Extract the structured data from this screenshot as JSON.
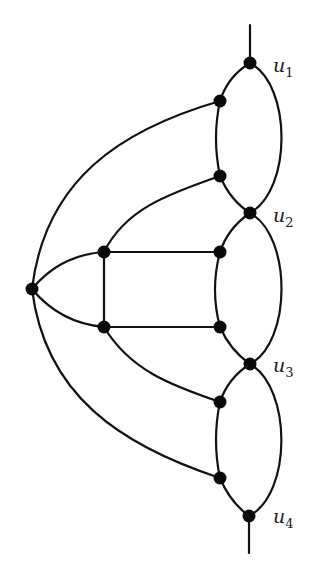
{
  "diagram": {
    "type": "graph",
    "colors": {
      "edge": "#111111",
      "node": "#0a0a0a",
      "background": "#ffffff"
    },
    "labels": [
      {
        "id": "u1",
        "base": "u",
        "sub": "1"
      },
      {
        "id": "u2",
        "base": "u",
        "sub": "2"
      },
      {
        "id": "u3",
        "base": "u",
        "sub": "3"
      },
      {
        "id": "u4",
        "base": "u",
        "sub": "4"
      }
    ],
    "nodes": [
      {
        "id": "u1",
        "x": 250,
        "y": 63
      },
      {
        "id": "a",
        "x": 220,
        "y": 101
      },
      {
        "id": "b",
        "x": 220,
        "y": 176
      },
      {
        "id": "u2",
        "x": 250,
        "y": 213
      },
      {
        "id": "sq_tl",
        "x": 104,
        "y": 252
      },
      {
        "id": "sq_tr",
        "x": 220,
        "y": 252
      },
      {
        "id": "hub",
        "x": 32,
        "y": 289
      },
      {
        "id": "sq_bl",
        "x": 104,
        "y": 327
      },
      {
        "id": "sq_br",
        "x": 220,
        "y": 327
      },
      {
        "id": "u3",
        "x": 250,
        "y": 364
      },
      {
        "id": "c",
        "x": 220,
        "y": 402
      },
      {
        "id": "d",
        "x": 220,
        "y": 478
      },
      {
        "id": "u4",
        "x": 249,
        "y": 516
      }
    ],
    "edges": [
      [
        "stub_top",
        "u1"
      ],
      [
        "u1",
        "a"
      ],
      [
        "a",
        "b"
      ],
      [
        "b",
        "u2"
      ],
      [
        "u1",
        "u2"
      ],
      [
        "u2",
        "sq_tr"
      ],
      [
        "sq_tr",
        "sq_br"
      ],
      [
        "sq_br",
        "u3"
      ],
      [
        "u2",
        "u3"
      ],
      [
        "u3",
        "c"
      ],
      [
        "c",
        "d"
      ],
      [
        "d",
        "u4"
      ],
      [
        "u3",
        "u4"
      ],
      [
        "u4",
        "stub_bottom"
      ],
      [
        "hub",
        "a"
      ],
      [
        "hub",
        "sq_tl"
      ],
      [
        "hub",
        "sq_bl"
      ],
      [
        "hub",
        "d"
      ],
      [
        "sq_tl",
        "b"
      ],
      [
        "sq_tl",
        "sq_tr"
      ],
      [
        "sq_tl",
        "sq_bl"
      ],
      [
        "sq_bl",
        "sq_br"
      ],
      [
        "sq_bl",
        "c"
      ]
    ]
  }
}
